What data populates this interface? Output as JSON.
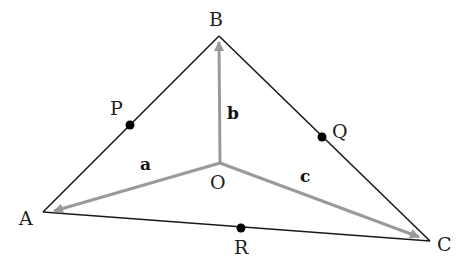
{
  "diagram": {
    "title": "",
    "colors": {
      "triangle": "#1a1a1a",
      "vector": "#9a9a9a",
      "point": "#000000",
      "background": "#ffffff"
    },
    "vertices": {
      "A": {
        "label": "A",
        "x": 43,
        "y": 212
      },
      "B": {
        "label": "B",
        "x": 219,
        "y": 36
      },
      "C": {
        "label": "C",
        "x": 430,
        "y": 241
      },
      "O": {
        "label": "O",
        "x": 220,
        "y": 163
      }
    },
    "midpoints": {
      "P": {
        "label": "P",
        "x": 130,
        "y": 125,
        "on_side": "AB"
      },
      "Q": {
        "label": "Q",
        "x": 322,
        "y": 137,
        "on_side": "BC"
      },
      "R": {
        "label": "R",
        "x": 241,
        "y": 228,
        "on_side": "AC"
      }
    },
    "vectors": {
      "a": {
        "label": "a",
        "from": "O",
        "to": "A"
      },
      "b": {
        "label": "b",
        "from": "O",
        "to": "B"
      },
      "c": {
        "label": "c",
        "from": "O",
        "to": "C"
      }
    }
  }
}
